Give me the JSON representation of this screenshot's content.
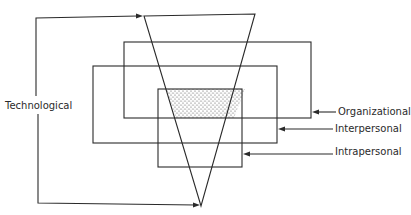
{
  "diagram": {
    "type": "layered-levels-diagram",
    "labels": {
      "technological": "Technological",
      "organizational": "Organizational",
      "interpersonal": "Interpersonal",
      "intrapersonal": "Intrapersonal"
    },
    "shapes": {
      "triangle": {
        "name": "Technological",
        "points": [
          [
            144,
            16
          ],
          [
            255,
            14
          ],
          [
            201,
            206
          ]
        ]
      },
      "rectangles": [
        {
          "name": "Organizational",
          "x": 124,
          "y": 42,
          "w": 187,
          "h": 76
        },
        {
          "name": "Interpersonal",
          "x": 93,
          "y": 66,
          "w": 184,
          "h": 77
        },
        {
          "name": "Intrapersonal",
          "x": 158,
          "y": 89,
          "w": 84,
          "h": 78
        }
      ],
      "shaded_overlap": "intersection of all four levels"
    },
    "colors": {
      "line": "#2a2a2a",
      "shade": "#bdbdbd",
      "background": "#ffffff"
    }
  }
}
